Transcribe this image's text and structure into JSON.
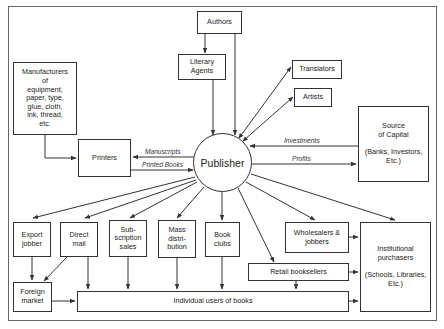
{
  "diagram": {
    "center": {
      "label": "Publisher"
    },
    "nodes": {
      "authors": "Authors",
      "literary_agents": "Literary\nAgents",
      "translators": "Translators",
      "artists": "Artists",
      "manufacturers": "Manufacturers\nof\nequipment,\npaper, type,\nglue, cloth,\nink, thread,\netc.",
      "printers": "Printers",
      "source_of_capital": "Source\nof Capital\n\n(Banks, Investors,\nEtc.)",
      "export_jobber": "Export\njobber",
      "direct_mail": "Direct\nmail",
      "subscription_sales": "Sub-\nscription\nsales",
      "mass_distribution": "Mass\ndistri-\nbution",
      "book_clubs": "Book\nclubs",
      "wholesalers": "Wholesalers &\njobbers",
      "retail_booksellers": "Retail booksellers",
      "institutional_purchasers": "Institutional\npurchasers\n\n(Schools, Libraries,\nEtc.)",
      "foreign_market": "Foreign\nmarket",
      "individual_users": "Individual users of books"
    },
    "edge_labels": {
      "manuscripts": "Manuscripts",
      "printed_books": "Printed Books",
      "investments": "Investments",
      "profits": "Profits"
    },
    "edges": [
      {
        "from": "Authors",
        "to": "Literary Agents"
      },
      {
        "from": "Authors",
        "to": "Publisher"
      },
      {
        "from": "Literary Agents",
        "to": "Publisher"
      },
      {
        "from": "Publisher",
        "to": "Translators",
        "bidirectional": true
      },
      {
        "from": "Publisher",
        "to": "Artists",
        "bidirectional": true
      },
      {
        "from": "Manufacturers",
        "to": "Printers"
      },
      {
        "from": "Publisher",
        "to": "Printers",
        "label": "Manuscripts"
      },
      {
        "from": "Printers",
        "to": "Publisher",
        "label": "Printed Books"
      },
      {
        "from": "Source of Capital",
        "to": "Publisher",
        "label": "Investments"
      },
      {
        "from": "Publisher",
        "to": "Source of Capital",
        "label": "Profits"
      },
      {
        "from": "Publisher",
        "to": "Export jobber"
      },
      {
        "from": "Publisher",
        "to": "Direct mail"
      },
      {
        "from": "Publisher",
        "to": "Subscription sales"
      },
      {
        "from": "Publisher",
        "to": "Mass distribution"
      },
      {
        "from": "Publisher",
        "to": "Book clubs"
      },
      {
        "from": "Publisher",
        "to": "Retail booksellers"
      },
      {
        "from": "Publisher",
        "to": "Wholesalers & jobbers"
      },
      {
        "from": "Publisher",
        "to": "Institutional purchasers"
      },
      {
        "from": "Export jobber",
        "to": "Foreign market"
      },
      {
        "from": "Direct mail",
        "to": "Foreign market"
      },
      {
        "from": "Direct mail",
        "to": "Individual users of books"
      },
      {
        "from": "Subscription sales",
        "to": "Individual users of books"
      },
      {
        "from": "Mass distribution",
        "to": "Individual users of books"
      },
      {
        "from": "Book clubs",
        "to": "Individual users of books"
      },
      {
        "from": "Foreign market",
        "to": "Individual users of books"
      },
      {
        "from": "Retail booksellers",
        "to": "Individual users of books"
      },
      {
        "from": "Wholesalers & jobbers",
        "to": "Institutional purchasers"
      },
      {
        "from": "Retail booksellers",
        "to": "Institutional purchasers"
      },
      {
        "from": "Individual users of books",
        "to": "Institutional purchasers"
      }
    ],
    "colors": {
      "line": "#333333",
      "frame": "#666666",
      "background": "#ffffff"
    }
  }
}
